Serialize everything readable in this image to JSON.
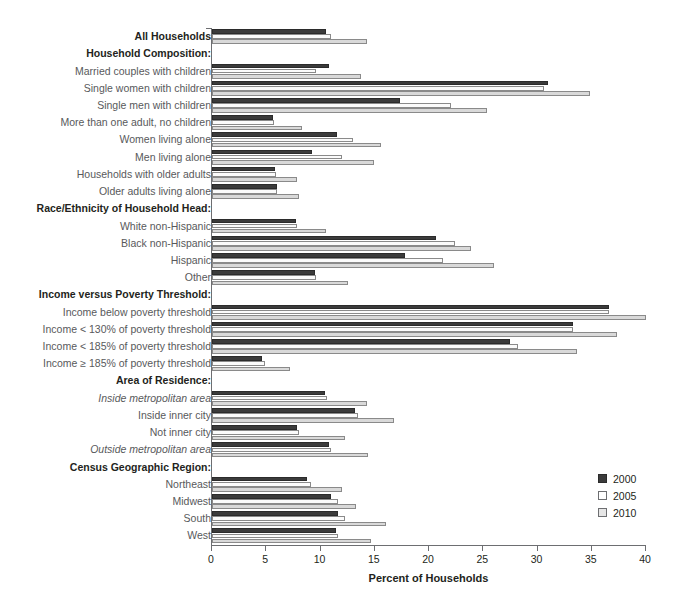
{
  "chart_data": {
    "type": "bar",
    "orientation": "horizontal",
    "title": "",
    "xlabel": "Percent of Households",
    "ylabel": "",
    "xlim": [
      0,
      40
    ],
    "xticks": [
      0,
      5,
      10,
      15,
      20,
      25,
      30,
      35,
      40
    ],
    "grid": false,
    "legend_position": "bottom-right",
    "series": [
      {
        "name": "2000",
        "color": "#3b3b3b"
      },
      {
        "name": "2005",
        "color": "#fbfbfb"
      },
      {
        "name": "2010",
        "color": "#d9d9d9"
      }
    ],
    "rows": [
      {
        "label": "All Households",
        "style": "header",
        "values": [
          10.5,
          11.0,
          14.3
        ]
      },
      {
        "label": "Household Composition:",
        "style": "section",
        "values": null
      },
      {
        "label": "Married couples with children",
        "style": "plain",
        "values": [
          10.8,
          9.6,
          13.7
        ]
      },
      {
        "label": "Single women with children",
        "style": "plain",
        "values": [
          31.0,
          30.6,
          34.8
        ]
      },
      {
        "label": "Single men with children",
        "style": "plain",
        "values": [
          17.3,
          22.0,
          25.3
        ]
      },
      {
        "label": "More than one adult, no children",
        "style": "plain",
        "values": [
          5.6,
          5.7,
          8.3
        ]
      },
      {
        "label": "Women living alone",
        "style": "plain",
        "values": [
          11.5,
          13.0,
          15.6
        ]
      },
      {
        "label": "Men living alone",
        "style": "plain",
        "values": [
          9.2,
          12.0,
          14.9
        ]
      },
      {
        "label": "Households with older adults",
        "style": "plain",
        "values": [
          5.8,
          5.9,
          7.8
        ]
      },
      {
        "label": "Older adults living alone",
        "style": "plain",
        "values": [
          6.0,
          6.0,
          8.0
        ]
      },
      {
        "label": "Race/Ethnicity of Household Head:",
        "style": "section",
        "values": null
      },
      {
        "label": "White non-Hispanic",
        "style": "plain",
        "values": [
          7.7,
          7.8,
          10.5
        ]
      },
      {
        "label": "Black non-Hispanic",
        "style": "plain",
        "values": [
          20.6,
          22.4,
          23.9
        ]
      },
      {
        "label": "Hispanic",
        "style": "plain",
        "values": [
          17.8,
          21.3,
          26.0
        ]
      },
      {
        "label": "Other",
        "style": "plain",
        "values": [
          9.5,
          9.6,
          12.5
        ]
      },
      {
        "label": "Income versus Poverty Threshold:",
        "style": "section",
        "values": null
      },
      {
        "label": "Income below poverty threshold",
        "style": "plain",
        "values": [
          36.6,
          36.6,
          40.0
        ]
      },
      {
        "label": "Income < 130% of poverty threshold",
        "style": "plain",
        "values": [
          33.3,
          33.3,
          37.3
        ]
      },
      {
        "label": "Income < 185% of poverty threshold",
        "style": "plain",
        "values": [
          27.5,
          28.2,
          33.6
        ]
      },
      {
        "label": "Income ≥ 185% of poverty threshold",
        "style": "plain",
        "values": [
          4.6,
          4.9,
          7.2
        ]
      },
      {
        "label": "Area of Residence:",
        "style": "section",
        "values": null
      },
      {
        "label": "Inside metropolitan area",
        "style": "italic",
        "values": [
          10.4,
          10.6,
          14.3
        ]
      },
      {
        "label": "Inside inner city",
        "style": "plain",
        "values": [
          13.2,
          13.5,
          16.8
        ]
      },
      {
        "label": "Not inner city",
        "style": "plain",
        "values": [
          7.8,
          8.0,
          12.3
        ]
      },
      {
        "label": "Outside metropolitan area",
        "style": "italic",
        "values": [
          10.8,
          11.0,
          14.4
        ]
      },
      {
        "label": "Census Geographic Region:",
        "style": "section",
        "values": null
      },
      {
        "label": "Northeast",
        "style": "plain",
        "values": [
          8.8,
          9.1,
          12.0
        ]
      },
      {
        "label": "Midwest",
        "style": "plain",
        "values": [
          11.0,
          11.6,
          13.3
        ]
      },
      {
        "label": "South",
        "style": "plain",
        "values": [
          11.6,
          12.3,
          16.0
        ]
      },
      {
        "label": "West",
        "style": "plain",
        "values": [
          11.4,
          11.6,
          14.7
        ]
      }
    ]
  },
  "axis": {
    "xlabel": "Percent of Households",
    "tick_labels": [
      "0",
      "5",
      "10",
      "15",
      "20",
      "25",
      "30",
      "35",
      "40"
    ]
  },
  "legend": {
    "items": [
      {
        "label": "2000",
        "key": "s2000"
      },
      {
        "label": "2005",
        "key": "s2005"
      },
      {
        "label": "2010",
        "key": "s2010"
      }
    ]
  }
}
